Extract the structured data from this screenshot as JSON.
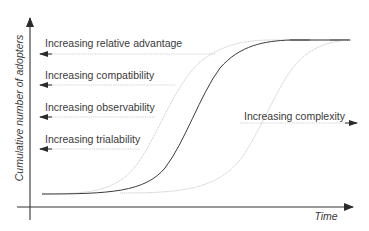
{
  "diagram": {
    "axes": {
      "y_label": "Cumulative number of adopters",
      "x_label": "Time"
    },
    "factors_left": [
      {
        "label": "Increasing relative advantage",
        "direction": "left"
      },
      {
        "label": "Increasing compatibility",
        "direction": "left"
      },
      {
        "label": "Increasing observability",
        "direction": "left"
      },
      {
        "label": "Increasing trialability",
        "direction": "left"
      }
    ],
    "factors_right": [
      {
        "label": "Increasing complexity",
        "direction": "right"
      }
    ],
    "curves": [
      {
        "name": "shifted-earlier",
        "style": "light-dotted",
        "color": "#c8c8c8"
      },
      {
        "name": "baseline",
        "style": "solid",
        "color": "#333333"
      },
      {
        "name": "shifted-later",
        "style": "light-dotted",
        "color": "#c8c8c8"
      }
    ],
    "colors": {
      "axis": "#333333",
      "text": "#3a3a3a",
      "guide": "#bdbdbd"
    }
  }
}
